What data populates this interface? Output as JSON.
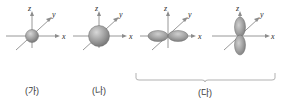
{
  "figure": {
    "title_visible": false,
    "background_color": "#ffffff",
    "axis_color": "#8c8c8c",
    "label_color": "#2b2b2b",
    "orbital_fill": "#9a9a9a",
    "orbital_edge": "#6e6e6e"
  },
  "diagrams": [
    {
      "id": "diagram-1",
      "label": "(가)",
      "orbital_type": "s",
      "shape": "sphere",
      "relative_size": "small",
      "axes": {
        "z": "z",
        "y": "y",
        "x": "x"
      }
    },
    {
      "id": "diagram-2",
      "label": "(나)",
      "orbital_type": "s",
      "shape": "sphere",
      "relative_size": "large",
      "axes": {
        "z": "z",
        "y": "y",
        "x": "x"
      }
    },
    {
      "id": "diagram-3",
      "label": "(다)",
      "orbital_type": "p",
      "shape": "dumbbell",
      "orientation": "x-axis",
      "axes": {
        "z": "z",
        "y": "y",
        "x": "x"
      }
    },
    {
      "id": "diagram-4",
      "label": "(다)",
      "orbital_type": "p",
      "shape": "dumbbell",
      "orientation": "z-axis",
      "axes": {
        "z": "z",
        "y": "y",
        "x": "x"
      }
    }
  ],
  "labels": {
    "first": "(가)",
    "second": "(나)",
    "third_group": "(다)"
  },
  "axis_names": {
    "z": "z",
    "y": "y",
    "x": "x"
  }
}
